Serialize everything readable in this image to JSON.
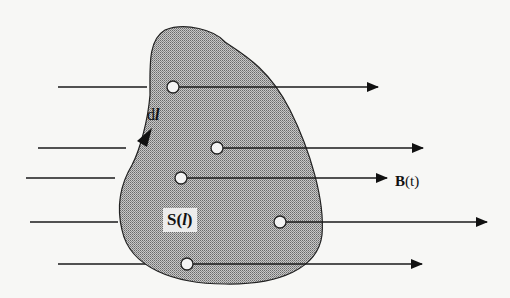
{
  "diagram": {
    "type": "magnetic flux through surface",
    "labels": {
      "dl": {
        "prefix": "d",
        "var": "l"
      },
      "field": {
        "symbol": "B",
        "arg": "(t)"
      },
      "surface": {
        "symbol": "S(",
        "var": "l",
        "close": ")"
      }
    },
    "field_lines": [
      {
        "y": 87,
        "left_start": 58,
        "left_end": 147,
        "circle_x": 173,
        "arrow_end": 378
      },
      {
        "y": 148,
        "left_start": 38,
        "left_end": 126,
        "circle_x": 217,
        "arrow_end": 423
      },
      {
        "y": 178,
        "left_start": 26,
        "left_end": 115,
        "circle_x": 181,
        "arrow_end": 387
      },
      {
        "y": 222,
        "left_start": 30,
        "left_end": 118,
        "circle_x": 280,
        "arrow_end": 487
      },
      {
        "y": 264,
        "left_start": 58,
        "left_end": 147,
        "circle_x": 187,
        "arrow_end": 422
      }
    ],
    "colors": {
      "surface_fill": "#9a9a9a",
      "line": "#1a1a1a",
      "background": "#f7f7f5"
    }
  }
}
